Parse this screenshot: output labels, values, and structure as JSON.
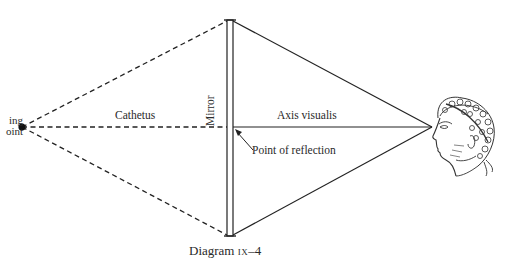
{
  "diagram": {
    "caption_prefix": "Diagram ",
    "caption_numeral": "ix",
    "caption_suffix": "–4",
    "labels": {
      "viewing_point": [
        "ing",
        "oint"
      ],
      "cathetus": "Cathetus",
      "axis_visualis": "Axis visualis",
      "point_of_reflection": "Point of reflection",
      "mirror": "Mirror"
    },
    "geometry": {
      "viewing_point": [
        22,
        127
      ],
      "eye_point": [
        432,
        127
      ],
      "mirror_x": [
        227,
        233
      ],
      "mirror_top_y": 20,
      "mirror_bottom_y": 236,
      "reflection_point": [
        233,
        127
      ]
    },
    "elements": {
      "dashed_lines": "viewing point to mirror top, mirror center, mirror bottom",
      "solid_lines": "mirror top, mirror center, mirror bottom to eye",
      "head": "classical profile head with laurel wreath, facing left"
    },
    "colors": {
      "ink": "#222222",
      "background": "#ffffff"
    }
  }
}
